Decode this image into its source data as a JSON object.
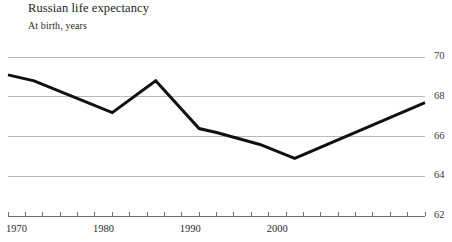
{
  "header": {
    "title": "Russian life expectancy",
    "subtitle": "At birth, years"
  },
  "chart_data": {
    "type": "line",
    "title": "Russian life expectancy",
    "subtitle": "At birth, years",
    "xlabel": "",
    "ylabel": "At birth, years",
    "xlim": [
      1970,
      2018
    ],
    "ylim": [
      62,
      70
    ],
    "yticks": [
      62,
      64,
      66,
      68,
      70
    ],
    "ytick_labels": [
      "62",
      "64",
      "66",
      "68",
      "70"
    ],
    "ytick_side": "right",
    "xticks": [
      1970,
      1980,
      1990,
      2000
    ],
    "xtick_labels": [
      "1970",
      "1980",
      "1990",
      "2000"
    ],
    "xtick_minor_interval": 2,
    "grid": true,
    "grid_axis": "y",
    "grid_color": "#b9b9b9",
    "legend": false,
    "line_color": "#111111",
    "line_width": 3,
    "series": [
      {
        "name": "Life expectancy at birth",
        "x": [
          1970,
          1973,
          1982,
          1987,
          1992,
          1994,
          1999,
          2003,
          2018
        ],
        "values": [
          69.1,
          68.8,
          67.2,
          68.8,
          66.4,
          66.2,
          65.6,
          64.9,
          67.7
        ]
      }
    ]
  }
}
